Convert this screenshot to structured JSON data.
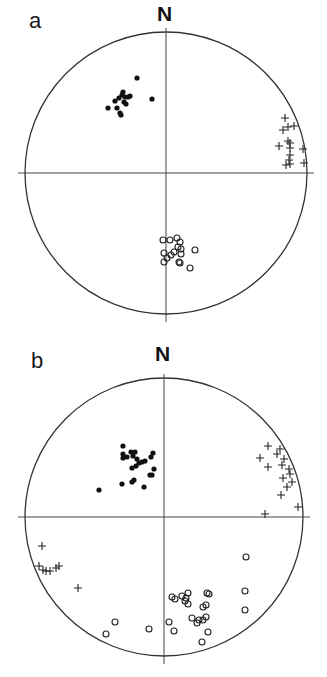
{
  "figure": {
    "panels": [
      {
        "label": "a",
        "north_label": "N"
      },
      {
        "label": "b",
        "north_label": "N"
      }
    ]
  },
  "chart_data": [
    {
      "type": "scatter",
      "subtype": "stereonet (equal-area lower hemisphere projection)",
      "title": "a",
      "north_label": "N",
      "grid": false,
      "axes": "N-S and E-W crosshair through net centre",
      "geometry": {
        "cx": 166,
        "cy": 173,
        "r": 141
      },
      "legend": [],
      "series": [
        {
          "name": "filled circles",
          "marker": "filled-circle",
          "points": [
            [
              -29,
              -95
            ],
            [
              -14,
              -74
            ],
            [
              -44,
              -78
            ],
            [
              -51,
              -72
            ],
            [
              -47,
              -75
            ],
            [
              -43,
              -81
            ],
            [
              -41,
              -76
            ],
            [
              -42,
              -71
            ],
            [
              -38,
              -76
            ],
            [
              -36,
              -77
            ],
            [
              -58,
              -65
            ],
            [
              -49,
              -65
            ],
            [
              -46,
              -60
            ],
            [
              -45,
              -58
            ],
            [
              -40,
              -69
            ]
          ]
        },
        {
          "name": "crosses",
          "marker": "plus",
          "points": [
            [
              119,
              -55
            ],
            [
              117,
              -43
            ],
            [
              122,
              -46
            ],
            [
              128,
              -47
            ],
            [
              113,
              -27
            ],
            [
              124,
              -30
            ],
            [
              122,
              -32
            ],
            [
              124,
              -25
            ],
            [
              137,
              -24
            ],
            [
              124,
              -18
            ],
            [
              123,
              -13
            ],
            [
              120,
              -8
            ],
            [
              124,
              -9
            ],
            [
              138,
              -10
            ]
          ]
        },
        {
          "name": "open circles",
          "marker": "open-circle",
          "points": [
            [
              -3,
              67
            ],
            [
              4,
              67
            ],
            [
              11,
              65
            ],
            [
              14,
              69
            ],
            [
              12,
              74
            ],
            [
              15,
              76
            ],
            [
              -2,
              80
            ],
            [
              5,
              82
            ],
            [
              8,
              79
            ],
            [
              15,
              81
            ],
            [
              29,
              77
            ],
            [
              14,
              90
            ],
            [
              1,
              85
            ],
            [
              24,
              95
            ],
            [
              -2,
              89
            ],
            [
              13,
              89
            ]
          ]
        }
      ]
    },
    {
      "type": "scatter",
      "subtype": "stereonet (equal-area lower hemisphere projection)",
      "title": "b",
      "north_label": "N",
      "grid": false,
      "axes": "N-S and E-W crosshair through net centre",
      "geometry": {
        "cx": 164,
        "cy": 517,
        "r": 139
      },
      "legend": [],
      "series": [
        {
          "name": "filled circles",
          "marker": "filled-circle",
          "points": [
            [
              -41,
              -71
            ],
            [
              -41,
              -63
            ],
            [
              -41,
              -59
            ],
            [
              -33,
              -65
            ],
            [
              -37,
              -60
            ],
            [
              -31,
              -61
            ],
            [
              -29,
              -65
            ],
            [
              -27,
              -58
            ],
            [
              -25,
              -54
            ],
            [
              -28,
              -51
            ],
            [
              -22,
              -55
            ],
            [
              -19,
              -56
            ],
            [
              -11,
              -64
            ],
            [
              -13,
              -60
            ],
            [
              -10,
              -48
            ],
            [
              -32,
              -49
            ],
            [
              -14,
              -42
            ],
            [
              -12,
              -42
            ],
            [
              -32,
              -35
            ],
            [
              -42,
              -33
            ],
            [
              -30,
              -37
            ],
            [
              -20,
              -30
            ],
            [
              -65,
              -27
            ]
          ]
        },
        {
          "name": "crosses",
          "marker": "plus",
          "points": [
            [
              104,
              -71
            ],
            [
              116,
              -68
            ],
            [
              113,
              -63
            ],
            [
              96,
              -59
            ],
            [
              120,
              -58
            ],
            [
              104,
              -50
            ],
            [
              118,
              -52
            ],
            [
              125,
              -48
            ],
            [
              126,
              -43
            ],
            [
              119,
              -39
            ],
            [
              128,
              -35
            ],
            [
              123,
              -30
            ],
            [
              117,
              -22
            ],
            [
              134,
              -10
            ],
            [
              101,
              -3
            ],
            [
              -122,
              29
            ],
            [
              -125,
              49
            ],
            [
              -121,
              53
            ],
            [
              -118,
              54
            ],
            [
              -114,
              54
            ],
            [
              -108,
              51
            ],
            [
              -105,
              49
            ],
            [
              -86,
              71
            ]
          ]
        },
        {
          "name": "open circles",
          "marker": "open-circle",
          "points": [
            [
              82,
              40
            ],
            [
              81,
              74
            ],
            [
              81,
              93
            ],
            [
              8,
              80
            ],
            [
              11,
              82
            ],
            [
              18,
              79
            ],
            [
              24,
              76
            ],
            [
              22,
              81
            ],
            [
              24,
              87
            ],
            [
              21,
              84
            ],
            [
              43,
              76
            ],
            [
              45,
              77
            ],
            [
              39,
              90
            ],
            [
              42,
              88
            ],
            [
              28,
              101
            ],
            [
              33,
              106
            ],
            [
              35,
              103
            ],
            [
              39,
              103
            ],
            [
              42,
              100
            ],
            [
              5,
              105
            ],
            [
              10,
              114
            ],
            [
              44,
              115
            ],
            [
              38,
              125
            ],
            [
              -15,
              112
            ],
            [
              -49,
              105
            ],
            [
              -58,
              117
            ]
          ]
        }
      ]
    }
  ]
}
